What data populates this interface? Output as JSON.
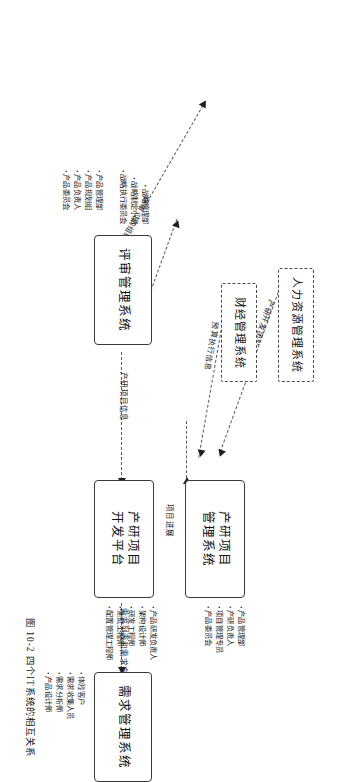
{
  "figure": {
    "caption": "图 10-2  四个IT系统的相互关系",
    "rotation_degrees": 90
  },
  "nodes": [
    {
      "id": "pm-system",
      "title_line1": "产研项目",
      "title_line2": "管理系统",
      "style": "solid",
      "roles": [
        "产品管理部",
        "产研负责人",
        "项目管理专员",
        "产品委员会"
      ]
    },
    {
      "id": "dev-platform",
      "title_line1": "产研项目",
      "title_line2": "开发平台",
      "style": "solid",
      "roles": [
        "产品研发负责人",
        "架构设计师",
        "研发工程师",
        "测试工程师",
        "配置管理工程师"
      ]
    },
    {
      "id": "review-system",
      "title_line1": "评审管理系统",
      "title_line2": "",
      "style": "solid",
      "roles": [
        "战略管理部",
        "战略制定小组",
        "战略执行委员会"
      ]
    },
    {
      "id": "requirement-system",
      "title_line1": "需求管理系统",
      "title_line2": "",
      "style": "solid",
      "roles": [
        "体验客户",
        "需求收集人员",
        "需求分析师",
        "产品设计师"
      ]
    },
    {
      "id": "hr-system",
      "title_line1": "人力资源管理系统",
      "title_line2": "",
      "style": "dashed",
      "roles": []
    },
    {
      "id": "finance-system",
      "title_line1": "财经管理系统",
      "title_line2": "",
      "style": "dashed",
      "roles": []
    }
  ],
  "extra_roles": [
    {
      "id": "product-dept-roles",
      "items": [
        "产品管理部",
        "产品规划组",
        "产品负责人",
        "产品委员会"
      ]
    }
  ],
  "edges": [
    {
      "id": "hr-to-pm",
      "label": "产研开发团队变动信息"
    },
    {
      "id": "finance-to-pm",
      "label": "预算执行信息"
    },
    {
      "id": "review-to-pm",
      "label": "产研项目信息"
    },
    {
      "id": "devplatform-to-pm",
      "label": "项目进展"
    },
    {
      "id": "req-to-devplatform",
      "label": "需求列表和需求方案"
    },
    {
      "id": "review-to-hr",
      "label": "评审过的组织调整建议"
    },
    {
      "id": "review-to-finance",
      "label": "部门预算信息"
    }
  ],
  "colors": {
    "stroke": "#3a3a3a",
    "dash": "#5a5a5a",
    "text": "#1a1a1a",
    "background": "#ffffff"
  }
}
